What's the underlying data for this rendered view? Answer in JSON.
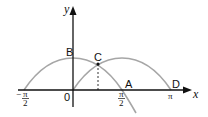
{
  "diagram": {
    "axes": {
      "x_label": "x",
      "y_label": "y",
      "origin_label": "0"
    },
    "x_ticks": [
      {
        "label_num": "π",
        "label_den": "2",
        "sign": "−",
        "value": "-π/2"
      },
      {
        "label_num": "π",
        "label_den": "2",
        "sign": "",
        "value": "π/2"
      },
      {
        "label": "π",
        "value": "π"
      }
    ],
    "points": {
      "A": "A",
      "B": "B",
      "C": "C",
      "D": "D"
    },
    "curves": [
      {
        "name": "cos-curve",
        "description": "y = cos x from -π/2 beyond π/2"
      },
      {
        "name": "sin-curve",
        "description": "y = sin x from 0 to π"
      }
    ],
    "colors": {
      "curve": "#a6a6a6",
      "axis": "#111111"
    }
  }
}
